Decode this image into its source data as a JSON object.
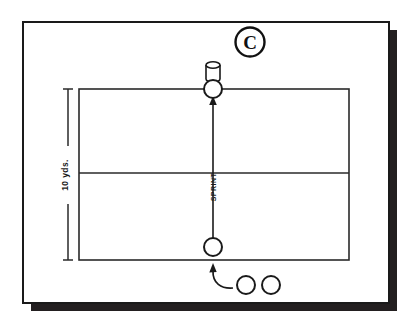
{
  "diagram": {
    "panel_label": "C",
    "distance_label": "10 yds.",
    "movement_label": "SPRINT",
    "colors": {
      "ink": "#1a1a1a",
      "paper": "#ffffff",
      "shadow": "#231f20"
    },
    "field": {
      "shape": "rectangle",
      "divider": "midline",
      "x": 79,
      "y": 89,
      "width": 270,
      "height": 171,
      "midline_y": 173
    },
    "frame": {
      "x": 23,
      "y": 22,
      "width": 366,
      "height": 281,
      "shadow_offset": 8
    },
    "markers": [
      {
        "name": "equipment-bag",
        "type": "cylinder",
        "cx": 213,
        "cy": 71
      },
      {
        "name": "player-target",
        "type": "circle",
        "cx": 213,
        "cy": 89,
        "r": 9
      },
      {
        "name": "player-start",
        "type": "circle",
        "cx": 213,
        "cy": 247,
        "r": 9
      },
      {
        "name": "player-queue-1",
        "type": "circle",
        "cx": 246,
        "cy": 285,
        "r": 9
      },
      {
        "name": "player-queue-2",
        "type": "circle",
        "cx": 271,
        "cy": 285,
        "r": 9
      }
    ],
    "arrows": [
      {
        "name": "sprint-arrow",
        "from_y": 240,
        "to_y": 98,
        "x": 213,
        "style": "straight"
      },
      {
        "name": "queue-entry-arrow",
        "style": "curved",
        "x": 213,
        "to_y": 262
      }
    ],
    "dimension": {
      "x": 68,
      "top_y": 89,
      "bottom_y": 260,
      "cap_half_width": 5
    }
  }
}
